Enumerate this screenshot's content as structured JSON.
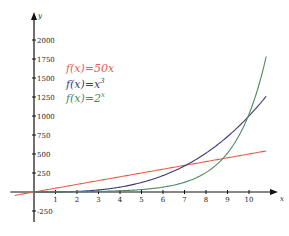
{
  "chart_data": {
    "type": "line",
    "title": "",
    "xlabel": "x",
    "ylabel": "y",
    "xlim": [
      -0.9,
      11
    ],
    "ylim": [
      -350,
      2250
    ],
    "x_ticks": [
      1,
      2,
      3,
      4,
      5,
      6,
      7,
      8,
      9,
      10
    ],
    "y_ticks": [
      -250,
      250,
      500,
      750,
      1000,
      1250,
      1500,
      1750,
      2000
    ],
    "grid": false,
    "legend_position": "upper-left-inside",
    "series": [
      {
        "name": "f(x)=50x",
        "color": "#e0604e",
        "x_range": [
          -0.9,
          10.8
        ],
        "expr": "50x"
      },
      {
        "name": "f(x)=x^3",
        "color": "#3c3c78",
        "x_range": [
          0,
          10.8
        ],
        "expr": "x^3"
      },
      {
        "name": "f(x)=2^x",
        "color": "#4e8a5e",
        "x_range": [
          0,
          10.8
        ],
        "expr": "2^x"
      }
    ]
  },
  "legend": {
    "items": [
      {
        "label": "f(x)=50x",
        "base": "f(x)=50x",
        "sup": "",
        "color": "#e0604e"
      },
      {
        "label": "f(x)=x",
        "base": "f(x)=x",
        "sup": "3",
        "color": "#3c3c78"
      },
      {
        "label": "f(x)=2",
        "base": "f(x)=2",
        "sup": "x",
        "color": "#4e8a5e"
      }
    ]
  }
}
